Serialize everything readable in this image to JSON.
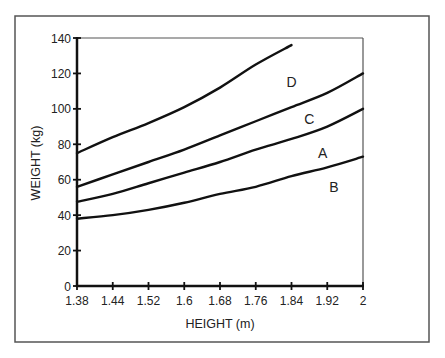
{
  "chart_data": {
    "type": "line",
    "title": "",
    "xlabel": "HEIGHT (m)",
    "ylabel": "WEIGHT (kg)",
    "x_tick_labels": [
      "1.38",
      "1.44",
      "1.52",
      "1.6",
      "1.68",
      "1.76",
      "1.84",
      "1.92",
      "2"
    ],
    "y_ticks": [
      0,
      20,
      40,
      60,
      80,
      100,
      120,
      140
    ],
    "ylim": [
      0,
      140
    ],
    "grid": false,
    "legend": "inline labels",
    "series": [
      {
        "name": "D",
        "values": [
          75,
          84,
          92,
          101,
          112,
          125,
          136,
          null,
          null
        ],
        "label_pos": [
          1.84,
          115
        ]
      },
      {
        "name": "C",
        "values": [
          56,
          63,
          70,
          77,
          85,
          93,
          101,
          109,
          120
        ],
        "label_pos": [
          1.88,
          94
        ]
      },
      {
        "name": "A",
        "values": [
          47.5,
          52,
          58,
          64,
          70,
          77,
          83,
          90,
          100
        ],
        "label_pos": [
          1.91,
          75
        ]
      },
      {
        "name": "B",
        "values": [
          38,
          40,
          43,
          47,
          52,
          56,
          62,
          67,
          73
        ],
        "label_pos": [
          1.935,
          56
        ]
      }
    ]
  }
}
